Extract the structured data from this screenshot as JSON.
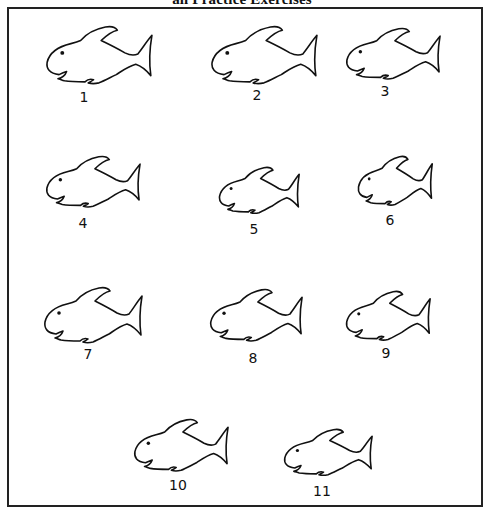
{
  "page": {
    "title": "an Practice Exercises"
  },
  "colors": {
    "stroke": "#111111",
    "background": "#ffffff",
    "frame": "#222222"
  },
  "fish": [
    {
      "id": 1,
      "label": "1",
      "x": 45,
      "y": 25,
      "w": 108,
      "h": 62,
      "label_x": 84,
      "label_y": 90
    },
    {
      "id": 2,
      "label": "2",
      "x": 210,
      "y": 25,
      "w": 108,
      "h": 62,
      "label_x": 257,
      "label_y": 88
    },
    {
      "id": 3,
      "label": "3",
      "x": 345,
      "y": 27,
      "w": 96,
      "h": 55,
      "label_x": 385,
      "label_y": 84
    },
    {
      "id": 4,
      "label": "4",
      "x": 45,
      "y": 155,
      "w": 96,
      "h": 55,
      "label_x": 83,
      "label_y": 216
    },
    {
      "id": 5,
      "label": "5",
      "x": 218,
      "y": 166,
      "w": 82,
      "h": 50,
      "label_x": 254,
      "label_y": 222
    },
    {
      "id": 6,
      "label": "6",
      "x": 357,
      "y": 155,
      "w": 76,
      "h": 53,
      "label_x": 390,
      "label_y": 213
    },
    {
      "id": 7,
      "label": "7",
      "x": 43,
      "y": 286,
      "w": 100,
      "h": 60,
      "label_x": 88,
      "label_y": 347
    },
    {
      "id": 8,
      "label": "8",
      "x": 209,
      "y": 288,
      "w": 94,
      "h": 56,
      "label_x": 253,
      "label_y": 351
    },
    {
      "id": 9,
      "label": "9",
      "x": 345,
      "y": 290,
      "w": 86,
      "h": 53,
      "label_x": 386,
      "label_y": 346
    },
    {
      "id": 10,
      "label": "10",
      "x": 133,
      "y": 418,
      "w": 96,
      "h": 56,
      "label_x": 178,
      "label_y": 478
    },
    {
      "id": 11,
      "label": "11",
      "x": 283,
      "y": 428,
      "w": 90,
      "h": 50,
      "label_x": 322,
      "label_y": 484
    }
  ]
}
